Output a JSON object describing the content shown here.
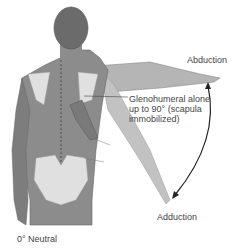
{
  "figure": {
    "labels": {
      "abduction": "Abduction",
      "adduction": "Adduction",
      "neutral": "0° Neutral",
      "glenohumeral": [
        "Glenohumeral alone",
        "up to 90° (scapula",
        "immobilized)"
      ]
    },
    "colors": {
      "body": "#8c8c8c",
      "head": "#6b6b6b",
      "arm_abducted": "#b5b5b5",
      "bone": "#e0e0e0",
      "arrow": "#222222",
      "text": "#444444"
    }
  }
}
